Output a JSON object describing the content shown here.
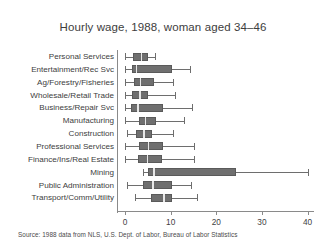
{
  "chart_data": {
    "type": "boxplot",
    "title": "Hourly wage, 1988, woman aged 34–46",
    "xlabel": "",
    "ylabel": "",
    "xlim": [
      0,
      41.5
    ],
    "grid": false,
    "legend": null,
    "xticks": [
      0,
      10,
      20,
      30,
      40
    ],
    "xticklabels": [
      "0",
      "10",
      "20",
      "30",
      "40"
    ],
    "categories": [
      "Personal Services",
      "Entertainment/Rec Svc",
      "Ag/Forestry/Fisheries",
      "Wholesale/Retail Trade",
      "Business/Repair Svc",
      "Manufacturing",
      "Construction",
      "Professional Services",
      "Finance/Ins/Real Estate",
      "Mining",
      "Public Administration",
      "Transport/Comm/Utility"
    ],
    "boxes": [
      {
        "category": "Personal Services",
        "min": 0.0,
        "q1": 1.8,
        "median": 3.5,
        "q3": 5.0,
        "max": 6.6
      },
      {
        "category": "Entertainment/Rec Svc",
        "min": 0.0,
        "q1": 1.5,
        "median": 2.4,
        "q3": 10.3,
        "max": 14.2
      },
      {
        "category": "Ag/Forestry/Fisheries",
        "min": 0.0,
        "q1": 2.0,
        "median": 3.3,
        "q3": 6.4,
        "max": 10.5
      },
      {
        "category": "Wholesale/Retail Trade",
        "min": 0.0,
        "q1": 1.6,
        "median": 3.1,
        "q3": 5.0,
        "max": 11.0
      },
      {
        "category": "Business/Repair Svc",
        "min": 0.0,
        "q1": 1.4,
        "median": 2.7,
        "q3": 8.4,
        "max": 14.7
      },
      {
        "category": "Manufacturing",
        "min": 0.0,
        "q1": 3.1,
        "median": 4.4,
        "q3": 6.8,
        "max": 13.0
      },
      {
        "category": "Construction",
        "min": 0.5,
        "q1": 2.5,
        "median": 4.0,
        "q3": 5.9,
        "max": 10.6
      },
      {
        "category": "Professional Services",
        "min": 0.0,
        "q1": 3.1,
        "median": 5.0,
        "q3": 8.4,
        "max": 15.2
      },
      {
        "category": "Finance/Ins/Real Estate",
        "min": 0.0,
        "q1": 2.9,
        "median": 4.8,
        "q3": 8.2,
        "max": 15.2
      },
      {
        "category": "Mining",
        "min": 4.0,
        "q1": 5.1,
        "median": 6.2,
        "q3": 24.4,
        "max": 40.0
      },
      {
        "category": "Public Administration",
        "min": 0.5,
        "q1": 4.0,
        "median": 6.0,
        "q3": 10.3,
        "max": 14.4
      },
      {
        "category": "Transport/Comm/Utility",
        "min": 2.3,
        "q1": 5.8,
        "median": 8.4,
        "q3": 10.3,
        "max": 15.7
      }
    ]
  },
  "footer": {
    "source": "Source:  1988 data from NLS, U.S. Dept. of Labor, Bureau of Labor Statistics"
  }
}
